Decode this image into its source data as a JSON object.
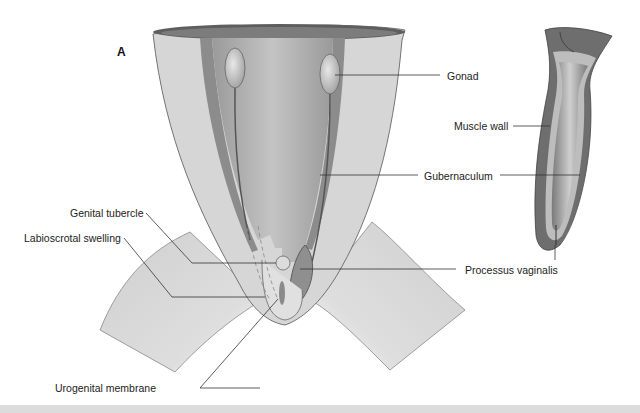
{
  "figure": {
    "panel_label": "A",
    "labels": {
      "gonad": "Gonad",
      "muscle_wall": "Muscle wall",
      "gubernaculum": "Gubernaculum",
      "genital_tubercle": "Genital tubercle",
      "labioscrotal_swelling": "Labioscrotal swelling",
      "processus_vaginalis": "Processus vaginalis",
      "urogenital_membrane": "Urogenital membrane"
    }
  },
  "colors": {
    "background": "#ffffff",
    "skin_light": "#d9d9d9",
    "wall_mid": "#a8a8a8",
    "wall_dark": "#6f6f6f",
    "leader_line": "#333333"
  }
}
